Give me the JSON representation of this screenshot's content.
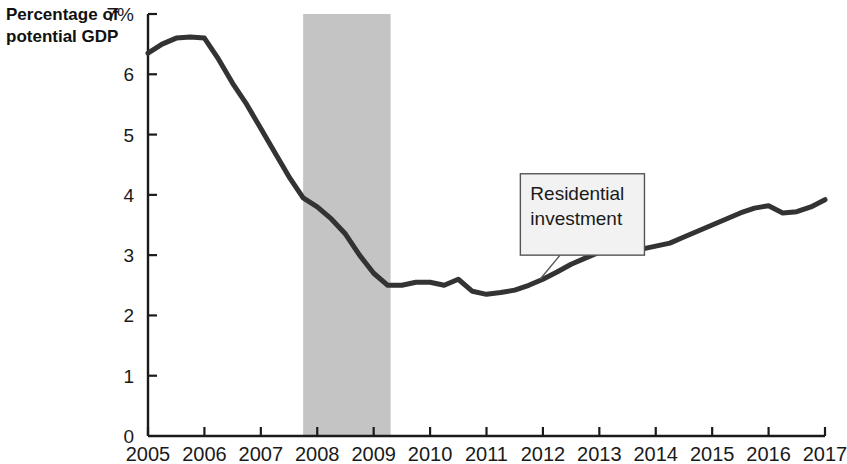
{
  "chart_data": {
    "type": "line",
    "title": "",
    "subtitle": "",
    "ylabel_line1": "Percentage of",
    "ylabel_line2": "potential GDP",
    "xlabel": "",
    "xlim": [
      2005,
      2017
    ],
    "ylim": [
      0,
      7
    ],
    "grid": false,
    "legend_position": "none",
    "y_ticks": [
      0,
      1,
      2,
      3,
      4,
      5,
      6,
      7
    ],
    "y_tick_labels": [
      "0",
      "1",
      "2",
      "3",
      "4",
      "5",
      "6",
      "7%"
    ],
    "x_ticks": [
      2005,
      2006,
      2007,
      2008,
      2009,
      2010,
      2011,
      2012,
      2013,
      2014,
      2015,
      2016,
      2017
    ],
    "x_tick_labels": [
      "2005",
      "2006",
      "2007",
      "2008",
      "2009",
      "2010",
      "2011",
      "2012",
      "2013",
      "2014",
      "2015",
      "2016",
      "2017"
    ],
    "series": [
      {
        "name": "Residential investment",
        "color": "#333333",
        "line_width": 5,
        "x": [
          2005.0,
          2005.25,
          2005.5,
          2005.75,
          2006.0,
          2006.25,
          2006.5,
          2006.75,
          2007.0,
          2007.25,
          2007.5,
          2007.75,
          2008.0,
          2008.25,
          2008.5,
          2008.75,
          2009.0,
          2009.25,
          2009.5,
          2009.75,
          2010.0,
          2010.25,
          2010.5,
          2010.75,
          2011.0,
          2011.25,
          2011.5,
          2011.75,
          2012.0,
          2012.25,
          2012.5,
          2012.75,
          2013.0,
          2013.25,
          2013.5,
          2013.75,
          2014.0,
          2014.25,
          2014.5,
          2014.75,
          2015.0,
          2015.25,
          2015.5,
          2015.75,
          2016.0,
          2016.25,
          2016.5,
          2016.75,
          2017.0
        ],
        "values": [
          6.35,
          6.5,
          6.6,
          6.62,
          6.6,
          6.25,
          5.85,
          5.5,
          5.1,
          4.7,
          4.3,
          3.95,
          3.8,
          3.6,
          3.35,
          3.0,
          2.7,
          2.5,
          2.5,
          2.55,
          2.55,
          2.5,
          2.6,
          2.4,
          2.35,
          2.38,
          2.42,
          2.5,
          2.6,
          2.72,
          2.85,
          2.95,
          3.05,
          3.1,
          3.12,
          3.1,
          3.15,
          3.2,
          3.3,
          3.4,
          3.5,
          3.6,
          3.7,
          3.78,
          3.82,
          3.7,
          3.72,
          3.8,
          3.92
        ]
      }
    ],
    "shaded_regions": [
      {
        "name": "recession-band",
        "x_start": 2007.75,
        "x_end": 2009.3,
        "y_start": 0,
        "y_end": 7,
        "color": "#c4c4c4"
      }
    ],
    "annotations": [
      {
        "name": "residential-investment-callout",
        "text_line1": "Residential",
        "text_line2": "investment",
        "box_x": 2011.6,
        "box_y_top": 4.35,
        "box_width_years": 2.2,
        "box_height_pct": 1.35,
        "leader_to_x": 2011.95,
        "leader_to_y": 2.6,
        "box_fill": "#f2f2f2",
        "box_stroke": "#555555"
      }
    ]
  }
}
